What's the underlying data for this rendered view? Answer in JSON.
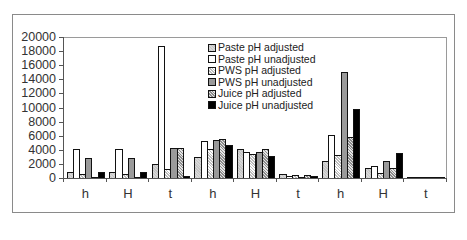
{
  "chart_data": {
    "type": "bar",
    "title": "",
    "xlabel": "",
    "ylabel": "",
    "ylim": [
      0,
      20000
    ],
    "yticks": [
      0,
      2000,
      4000,
      6000,
      8000,
      10000,
      12000,
      14000,
      16000,
      18000,
      20000
    ],
    "grid": false,
    "legend_position": "upper-center-inside",
    "categories": [
      "h",
      "H",
      "t",
      "h",
      "H",
      "t",
      "h",
      "H",
      "t"
    ],
    "series": [
      {
        "name": "Paste pH adjusted",
        "values": [
          1000,
          1000,
          2100,
          3100,
          4200,
          700,
          2500,
          1500,
          100
        ]
      },
      {
        "name": "Paste pH unadjusted",
        "values": [
          4300,
          4300,
          18800,
          5400,
          3900,
          400,
          6300,
          1800,
          100
        ]
      },
      {
        "name": "PWS pH adjusted",
        "values": [
          700,
          700,
          1400,
          4300,
          3600,
          600,
          3400,
          800,
          100
        ]
      },
      {
        "name": "PWS pH unadjusted",
        "values": [
          3000,
          3000,
          4400,
          5600,
          3900,
          300,
          15200,
          2500,
          200
        ]
      },
      {
        "name": "Juice pH adjusted",
        "values": [
          300,
          300,
          4400,
          5700,
          4200,
          500,
          6000,
          1500,
          200
        ]
      },
      {
        "name": "Juice pH unadjusted",
        "values": [
          1000,
          1000,
          400,
          4800,
          3300,
          400,
          10000,
          3700,
          100
        ]
      }
    ]
  }
}
